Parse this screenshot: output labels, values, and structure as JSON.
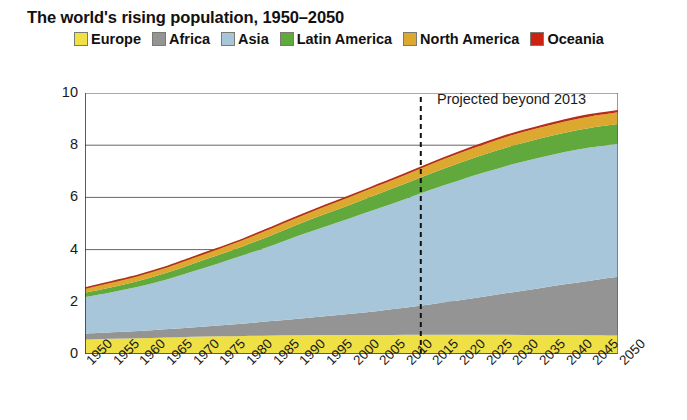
{
  "title": "The world's rising population, 1950–2050",
  "legend": {
    "position": "top",
    "items": [
      {
        "label": "Europe",
        "color": "#efe046"
      },
      {
        "label": "Africa",
        "color": "#949494"
      },
      {
        "label": "Asia",
        "color": "#a8c6da"
      },
      {
        "label": "Latin America",
        "color": "#62a93d"
      },
      {
        "label": "North America",
        "color": "#dda82f"
      },
      {
        "label": "Oceania",
        "color": "#cc2211"
      }
    ]
  },
  "annotation": {
    "text": "Projected beyond 2013",
    "marker_year": 2013,
    "line_style": "dashed",
    "line_color": "#111111"
  },
  "axes": {
    "y_title": "Population (billion)",
    "y_ticks": [
      "0",
      "2",
      "4",
      "6",
      "8",
      "10"
    ],
    "y_min": 0,
    "y_max": 10,
    "x_title": "",
    "x_ticks": [
      "1950",
      "1955",
      "1960",
      "1965",
      "1970",
      "1975",
      "1980",
      "1985",
      "1990",
      "1995",
      "2000",
      "2005",
      "2010",
      "2015",
      "2020",
      "2025",
      "2030",
      "2035",
      "2040",
      "2045",
      "2050"
    ],
    "x_min": 1950,
    "x_max": 2050,
    "grid": "horizontal"
  },
  "chart_data": {
    "type": "area",
    "title": "The world's rising population, 1950–2050",
    "xlabel": "",
    "ylabel": "Population (billion)",
    "ylim": [
      0,
      10
    ],
    "xlim": [
      1950,
      2050
    ],
    "stacked": true,
    "grid": true,
    "legend_position": "top",
    "x": [
      1950,
      1955,
      1960,
      1965,
      1970,
      1975,
      1980,
      1985,
      1990,
      1995,
      2000,
      2005,
      2010,
      2015,
      2020,
      2025,
      2030,
      2035,
      2040,
      2045,
      2050
    ],
    "series": [
      {
        "name": "Europe",
        "color": "#efe046",
        "values": [
          0.55,
          0.58,
          0.6,
          0.63,
          0.66,
          0.68,
          0.69,
          0.71,
          0.72,
          0.73,
          0.73,
          0.73,
          0.74,
          0.74,
          0.74,
          0.74,
          0.74,
          0.73,
          0.73,
          0.72,
          0.71
        ]
      },
      {
        "name": "Africa",
        "color": "#949494",
        "values": [
          0.23,
          0.25,
          0.28,
          0.32,
          0.36,
          0.41,
          0.48,
          0.55,
          0.63,
          0.72,
          0.81,
          0.92,
          1.03,
          1.17,
          1.31,
          1.46,
          1.62,
          1.78,
          1.94,
          2.1,
          2.25
        ]
      },
      {
        "name": "Asia",
        "color": "#a8c6da",
        "values": [
          1.4,
          1.54,
          1.7,
          1.89,
          2.13,
          2.38,
          2.63,
          2.89,
          3.18,
          3.43,
          3.68,
          3.92,
          4.16,
          4.39,
          4.59,
          4.76,
          4.9,
          5.0,
          5.07,
          5.1,
          5.1
        ]
      },
      {
        "name": "Latin America",
        "color": "#62a93d",
        "values": [
          0.17,
          0.19,
          0.22,
          0.25,
          0.29,
          0.32,
          0.36,
          0.4,
          0.44,
          0.48,
          0.52,
          0.56,
          0.59,
          0.63,
          0.66,
          0.69,
          0.71,
          0.73,
          0.74,
          0.75,
          0.75
        ]
      },
      {
        "name": "North America",
        "color": "#dda82f",
        "values": [
          0.17,
          0.19,
          0.2,
          0.21,
          0.23,
          0.24,
          0.25,
          0.27,
          0.28,
          0.3,
          0.31,
          0.33,
          0.34,
          0.36,
          0.38,
          0.39,
          0.41,
          0.42,
          0.43,
          0.44,
          0.45
        ]
      },
      {
        "name": "Oceania",
        "color": "#cc2211",
        "values": [
          0.013,
          0.014,
          0.016,
          0.017,
          0.019,
          0.021,
          0.023,
          0.025,
          0.027,
          0.029,
          0.031,
          0.033,
          0.036,
          0.039,
          0.042,
          0.045,
          0.048,
          0.051,
          0.054,
          0.057,
          0.06
        ]
      }
    ],
    "totals": [
      2.53,
      2.77,
      3.02,
      3.32,
      3.69,
      4.05,
      4.43,
      4.85,
      5.28,
      5.69,
      6.08,
      6.49,
      6.9,
      7.32,
      7.72,
      8.09,
      8.43,
      8.71,
      8.96,
      9.17,
      9.32
    ],
    "annotations": [
      {
        "text": "Projected beyond 2013",
        "x": 2013,
        "type": "vline-dashed"
      }
    ]
  }
}
